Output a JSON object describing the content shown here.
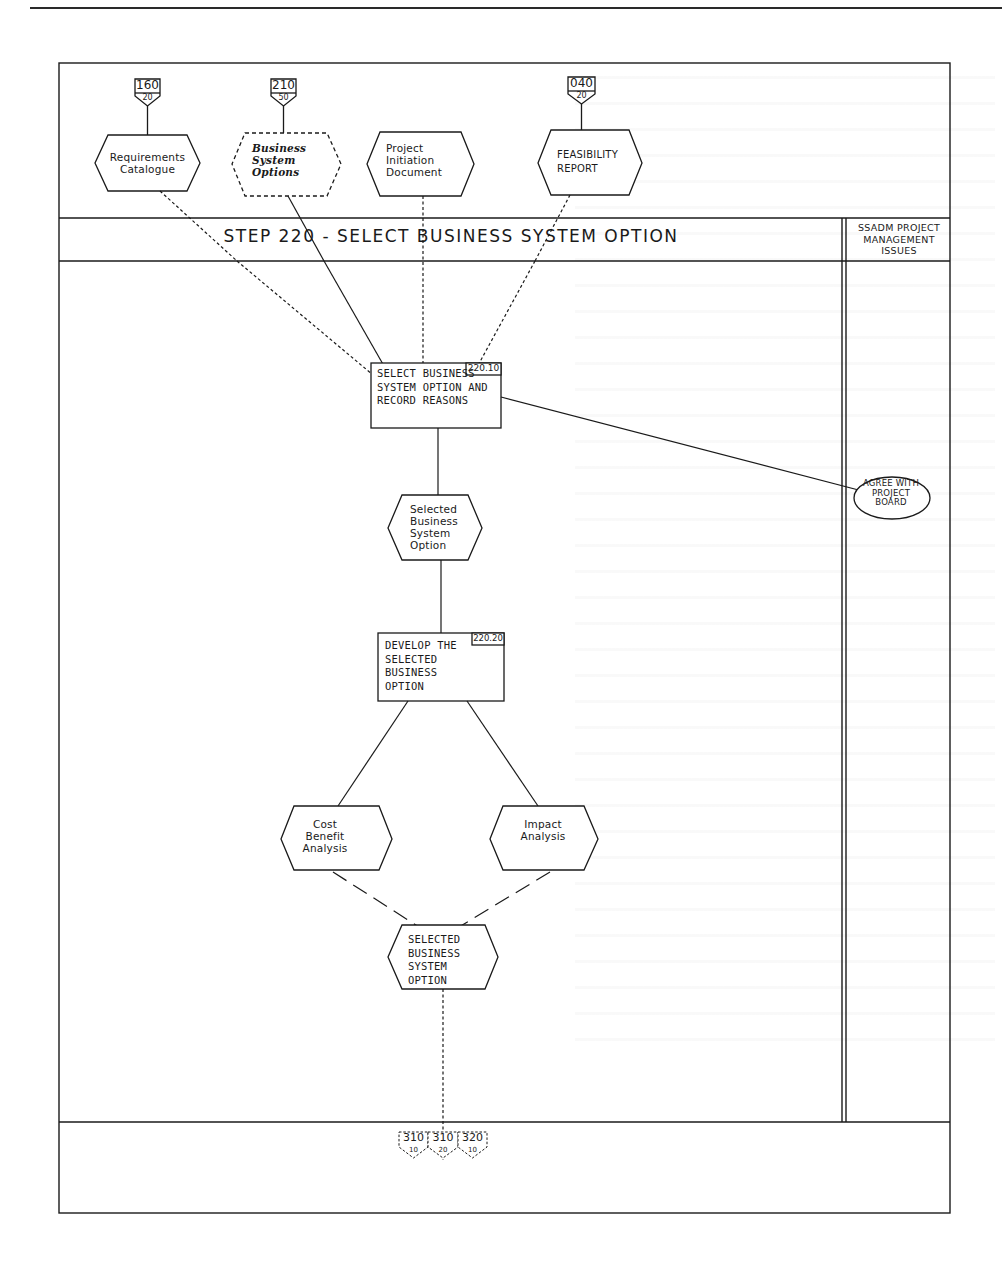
{
  "page": {
    "background": "#ffffff",
    "ink_color": "#1a1a1a"
  },
  "step": {
    "title": "STEP 220 - SELECT BUSINESS SYSTEM OPTION",
    "management_column_title": "SSADM PROJECT MANAGEMENT ISSUES"
  },
  "inputs": [
    {
      "id": "requirements-catalogue",
      "label": "Requirements Catalogue",
      "ref_top": "160",
      "ref_bottom": "20",
      "style": "solid"
    },
    {
      "id": "business-system-options",
      "label": "Business System Options",
      "ref_top": "210",
      "ref_bottom": "50",
      "style": "dashed-italic"
    },
    {
      "id": "project-initiation-document",
      "label": "Project Initiation Document",
      "ref_top": "",
      "ref_bottom": "",
      "style": "solid"
    },
    {
      "id": "feasibility-report",
      "label": "FEASIBILITY REPORT",
      "ref_top": "040",
      "ref_bottom": "20",
      "style": "solid"
    }
  ],
  "processes": [
    {
      "id": "220.10",
      "label": "SELECT BUSINESS SYSTEM OPTION AND RECORD REASONS"
    },
    {
      "id": "220.20",
      "label": "DEVELOP THE SELECTED BUSINESS OPTION"
    }
  ],
  "products": [
    {
      "id": "selected-bso-intermediate",
      "label": "Selected Business System Option"
    },
    {
      "id": "cost-benefit-analysis",
      "label": "Cost Benefit Analysis"
    },
    {
      "id": "impact-analysis",
      "label": "Impact Analysis"
    },
    {
      "id": "selected-bso-final",
      "label": "SELECTED BUSINESS SYSTEM OPTION"
    }
  ],
  "management_activities": [
    {
      "id": "agree-with-project-board",
      "label": "AGREE WITH PROJECT BOARD"
    }
  ],
  "outputs": [
    {
      "ref_top": "310",
      "ref_bottom": "10"
    },
    {
      "ref_top": "310",
      "ref_bottom": "20"
    },
    {
      "ref_top": "320",
      "ref_bottom": "10"
    }
  ]
}
